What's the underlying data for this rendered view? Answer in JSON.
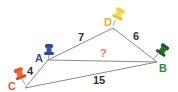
{
  "diagram": {
    "points": {
      "A": {
        "label": "A",
        "color": "#2f4f9a",
        "pin_color": "#2a4aa0"
      },
      "B": {
        "label": "B",
        "color": "#2e8b3a",
        "pin_color": "#1f5e25"
      },
      "C": {
        "label": "C",
        "color": "#e0582a",
        "pin_color": "#e8552a"
      },
      "D": {
        "label": "D",
        "color": "#f0a830",
        "pin_color": "#f2cf3a"
      }
    },
    "segments": {
      "AD": {
        "label": "7",
        "color": "#333333"
      },
      "DB": {
        "label": "6",
        "color": "#333333"
      },
      "AB": {
        "label": "?",
        "color": "#f07a50"
      },
      "AC": {
        "label": "4",
        "color": "#333333"
      },
      "CB": {
        "label": "15",
        "color": "#333333"
      }
    },
    "line_color": "#8a8a8a"
  }
}
